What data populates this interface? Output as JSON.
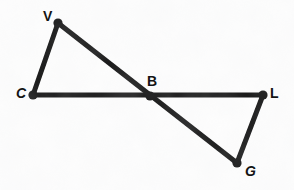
{
  "figure": {
    "type": "line-diagram",
    "background_color": "#fdfdfd",
    "stroke_color": "#141414",
    "stroke_width": 5,
    "vertex_dot_radius": 4,
    "canvas": {
      "width": 294,
      "height": 190
    },
    "points": {
      "V": {
        "x": 58,
        "y": 23,
        "label": "V"
      },
      "C": {
        "x": 33,
        "y": 95,
        "label": "C"
      },
      "B": {
        "x": 150,
        "y": 96,
        "label": "B"
      },
      "L": {
        "x": 263,
        "y": 95,
        "label": "L"
      },
      "G": {
        "x": 237,
        "y": 163,
        "label": "G"
      }
    },
    "segments": [
      {
        "name": "segment-V-C",
        "from": "V",
        "to": "C"
      },
      {
        "name": "segment-V-G",
        "from": "V",
        "to": "G"
      },
      {
        "name": "segment-C-L",
        "from": "C",
        "to": "L"
      },
      {
        "name": "segment-L-G",
        "from": "L",
        "to": "G"
      }
    ],
    "labels": [
      {
        "name": "vertex-label-V",
        "text": "V",
        "x": 43,
        "y": 9,
        "slant": false
      },
      {
        "name": "vertex-label-C",
        "text": "C",
        "x": 16,
        "y": 86,
        "slant": true
      },
      {
        "name": "vertex-label-B",
        "text": "B",
        "x": 147,
        "y": 74,
        "slant": false
      },
      {
        "name": "vertex-label-L",
        "text": "L",
        "x": 270,
        "y": 86,
        "slant": false
      },
      {
        "name": "vertex-label-G",
        "text": "G",
        "x": 245,
        "y": 164,
        "slant": true
      }
    ]
  }
}
